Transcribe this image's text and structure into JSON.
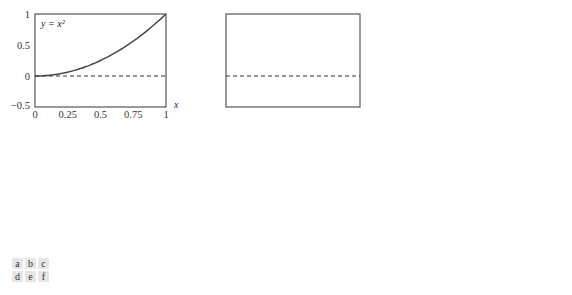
{
  "chart_data": [
    {
      "id": "a",
      "type": "line",
      "label": "y = x²",
      "xlabel": "x",
      "xlim": [
        0,
        1
      ],
      "ylim": [
        -0.5,
        1
      ],
      "xticks": [
        "0",
        "0.25",
        "0.5",
        "0.75",
        "1"
      ],
      "yticks": [
        "1",
        "0.5",
        "0",
        "−0.5"
      ],
      "x": [
        0,
        0.1,
        0.2,
        0.3,
        0.4,
        0.5,
        0.6,
        0.7,
        0.8,
        0.9,
        1
      ],
      "values": [
        0,
        0.01,
        0.04,
        0.09,
        0.16,
        0.25,
        0.36,
        0.49,
        0.64,
        0.81,
        1
      ],
      "reference_line": 0
    },
    {
      "id": "b",
      "type": "step",
      "label": "V₀",
      "xlabel": "x",
      "xlim": [
        0,
        1
      ],
      "ylim": [
        -0.5,
        1
      ],
      "breaks": [
        0,
        1
      ],
      "values": [
        0.33
      ],
      "annotation": "1/3φ₀,₀",
      "reference_line": 0
    },
    {
      "id": "c",
      "type": "step",
      "label": "W₀",
      "xlabel": "x",
      "xlim": [
        0,
        1
      ],
      "ylim": [
        -0.5,
        1
      ],
      "breaks": [
        0,
        0.5,
        1
      ],
      "values": [
        -0.2,
        0.28
      ],
      "annotation": "−1/4ψ₀,₀",
      "reference_line": 0
    },
    {
      "id": "d",
      "type": "step",
      "label": "V₁",
      "xlabel": "x",
      "xlim": [
        0,
        1
      ],
      "ylim": [
        -0.5,
        1
      ],
      "breaks": [
        0,
        0.5,
        1
      ],
      "values": [
        0.1,
        0.6
      ],
      "reference_line": 0
    },
    {
      "id": "e",
      "type": "step",
      "label": "W₁",
      "xlabel": "x",
      "xlim": [
        0,
        1
      ],
      "ylim": [
        -0.5,
        1
      ],
      "breaks": [
        0,
        0.25,
        0.5,
        0.75,
        1
      ],
      "values": [
        -0.04,
        0.06,
        -0.19,
        0.26
      ],
      "annotations": [
        "−√2/32ψ₁,₀",
        "−3√2/32ψ₁,₁"
      ],
      "reference_line": 0
    },
    {
      "id": "f",
      "type": "step",
      "label": "V₂",
      "xlabel": "x",
      "xlim": [
        0,
        1
      ],
      "ylim": [
        -0.5,
        1
      ],
      "breaks": [
        0,
        0.25,
        0.5,
        0.75,
        1
      ],
      "values": [
        0.03,
        0.17,
        0.39,
        0.88
      ],
      "reference_line": 0
    }
  ],
  "legend_panels": [
    "a",
    "b",
    "c",
    "d",
    "e",
    "f"
  ],
  "colors": {
    "line": "#444444",
    "axis": "#555555",
    "dash": "#333333"
  }
}
